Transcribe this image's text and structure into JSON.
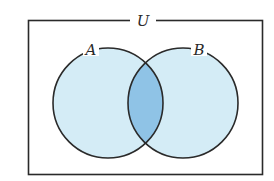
{
  "diagram": {
    "type": "venn",
    "universe_label": "U",
    "sets": [
      {
        "label": "A",
        "cx": 108,
        "cy": 103,
        "r": 55
      },
      {
        "label": "B",
        "cx": 183,
        "cy": 103,
        "r": 55
      }
    ],
    "highlighted_region": "A ∩ B",
    "colors": {
      "set_fill": "#d4ecf6",
      "intersection_fill": "#8fc3e6",
      "stroke": "#2a2a2a",
      "background": "#ffffff"
    }
  }
}
